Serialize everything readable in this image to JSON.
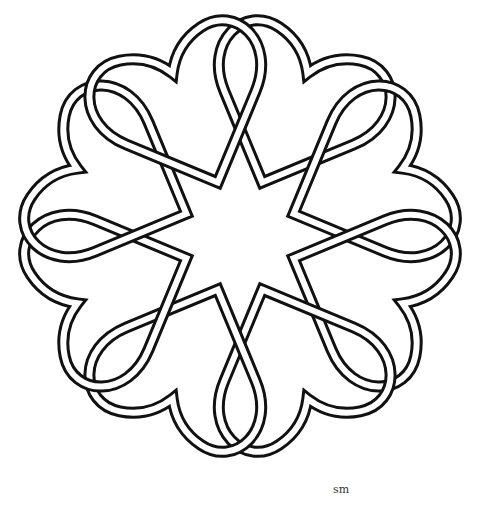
{
  "artwork": {
    "title": "Eight interlaced hearts forming an eight-pointed star",
    "heart_count": 8,
    "stroke_color": "#111111",
    "background": "#ffffff"
  },
  "signature": {
    "text": "sm"
  }
}
